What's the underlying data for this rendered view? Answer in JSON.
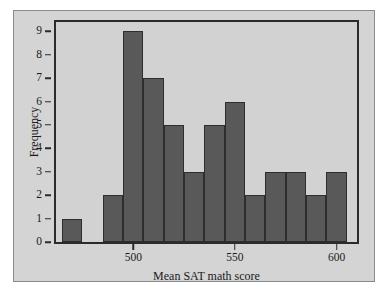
{
  "figure": {
    "background_color": "#d4d4d4",
    "border_color": "#8a8a8a",
    "plot_background_color": "#d2d2d2",
    "bar_color": "#595959",
    "bar_edge_color": "#2e2e2e",
    "axis_color": "#2b2b2b"
  },
  "caption": {
    "text": ""
  },
  "chart_data": {
    "type": "bar",
    "title": "",
    "xlabel": "Mean SAT math score",
    "ylabel": "Frequency",
    "xlim": [
      462,
      610
    ],
    "ylim": [
      0,
      9.4
    ],
    "grid": false,
    "legend": null,
    "xticks": [
      500,
      550,
      600
    ],
    "xtick_labels": [
      "500",
      "550",
      "600"
    ],
    "yticks": [
      0,
      1,
      2,
      3,
      4,
      5,
      6,
      7,
      8,
      9
    ],
    "ytick_labels": [
      "0",
      "1",
      "2",
      "3",
      "4",
      "5",
      "6",
      "7",
      "8",
      "9"
    ],
    "bin_width": 10,
    "bins": [
      {
        "left": 465,
        "right": 475,
        "value": 1
      },
      {
        "left": 485,
        "right": 495,
        "value": 2
      },
      {
        "left": 495,
        "right": 505,
        "value": 9
      },
      {
        "left": 505,
        "right": 515,
        "value": 7
      },
      {
        "left": 515,
        "right": 525,
        "value": 5
      },
      {
        "left": 525,
        "right": 535,
        "value": 3
      },
      {
        "left": 535,
        "right": 545,
        "value": 5
      },
      {
        "left": 545,
        "right": 555,
        "value": 6
      },
      {
        "left": 555,
        "right": 565,
        "value": 2
      },
      {
        "left": 565,
        "right": 575,
        "value": 3
      },
      {
        "left": 575,
        "right": 585,
        "value": 3
      },
      {
        "left": 585,
        "right": 595,
        "value": 2
      },
      {
        "left": 595,
        "right": 605,
        "value": 3
      }
    ],
    "categories": [
      "465-475",
      "485-495",
      "495-505",
      "505-515",
      "515-525",
      "525-535",
      "535-545",
      "545-555",
      "555-565",
      "565-575",
      "575-585",
      "585-595",
      "595-605"
    ],
    "values": [
      1,
      2,
      9,
      7,
      5,
      3,
      5,
      6,
      2,
      3,
      3,
      2,
      3
    ]
  }
}
